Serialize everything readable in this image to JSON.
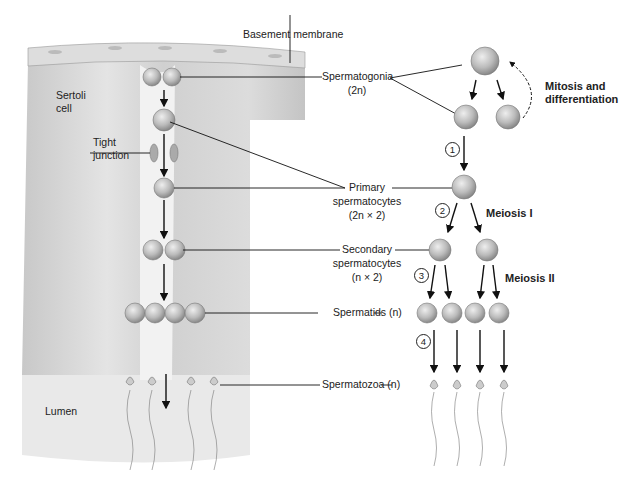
{
  "figure": {
    "labels": {
      "basement_membrane": "Basement membrane",
      "sertoli": "Sertoli",
      "sertoli2": "cell",
      "tight": "Tight",
      "tight2": "junction",
      "lumen": "Lumen",
      "spermatogonia": "Spermatogonia",
      "spermatogonia_ploidy": "(2n)",
      "primary1": "Primary",
      "primary2": "spermatocytes",
      "primary3": "(2n × 2)",
      "secondary1": "Secondary",
      "secondary2": "spermatocytes",
      "secondary3": "(n × 2)",
      "spermatids": "Spermatids (n)",
      "spermatozoa": "Spermatozoa (n)",
      "mitosis1": "Mitosis and",
      "mitosis2": "differentiation",
      "meiosis1": "Meiosis I",
      "meiosis2": "Meiosis II"
    },
    "steps": [
      "1",
      "2",
      "3",
      "4"
    ]
  }
}
